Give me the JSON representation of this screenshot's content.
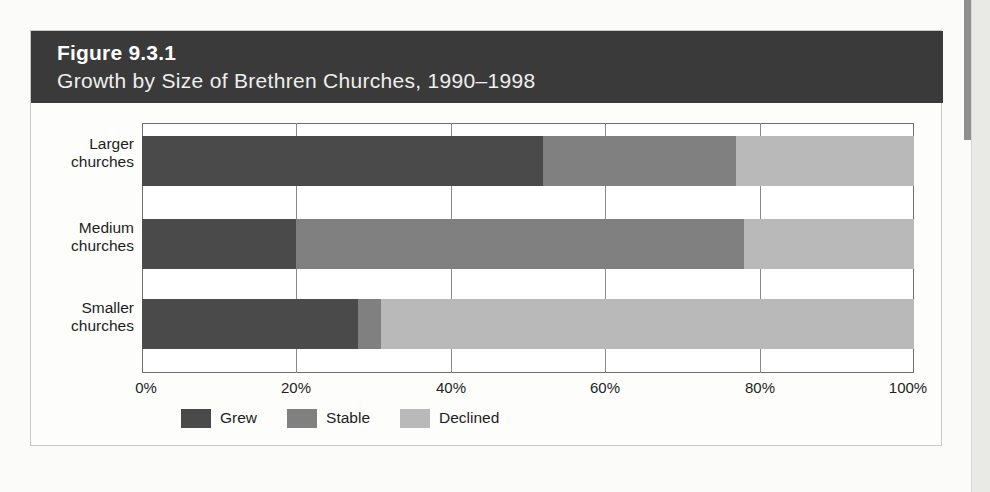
{
  "figure": {
    "number": "Figure 9.3.1",
    "title": "Growth by Size of Brethren Churches, 1990–1998"
  },
  "colors": {
    "header_band": "#3a3a3a",
    "grew": "#4a4a4a",
    "stable": "#808080",
    "declined": "#b9b9b9",
    "page_background": "#fbfbf9",
    "plot_background": "#ffffff",
    "axis": "#6e6e6e"
  },
  "chart_data": {
    "type": "bar",
    "orientation": "horizontal",
    "stacked": true,
    "stack_normalized": true,
    "title": "Growth by Size of Brethren Churches, 1990–1998",
    "xlabel": "",
    "ylabel": "",
    "xlim": [
      0,
      100
    ],
    "xticks": [
      0,
      20,
      40,
      60,
      80,
      100
    ],
    "xtick_labels": [
      "0%",
      "20%",
      "40%",
      "60%",
      "80%",
      "100%"
    ],
    "grid": true,
    "legend_position": "bottom-left",
    "categories": [
      "Larger churches",
      "Medium churches",
      "Smaller churches"
    ],
    "category_labels": [
      {
        "line1": "Larger",
        "line2": "churches"
      },
      {
        "line1": "Medium",
        "line2": "churches"
      },
      {
        "line1": "Smaller",
        "line2": "churches"
      }
    ],
    "series": [
      {
        "name": "Grew",
        "color": "#4a4a4a",
        "values": [
          52,
          20,
          28
        ]
      },
      {
        "name": "Stable",
        "color": "#808080",
        "values": [
          25,
          58,
          3
        ]
      },
      {
        "name": "Declined",
        "color": "#b9b9b9",
        "values": [
          23,
          22,
          69
        ]
      }
    ],
    "legend": [
      "Grew",
      "Stable",
      "Declined"
    ]
  }
}
